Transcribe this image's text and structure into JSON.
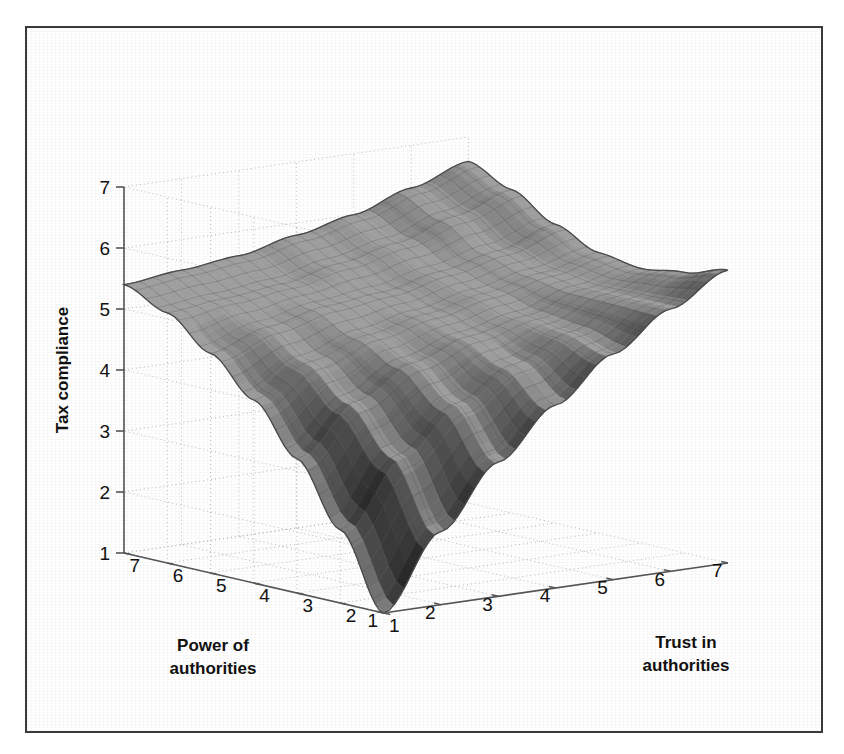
{
  "figure": {
    "background_color": "#ffffff",
    "frame_color": "#3a3a3a",
    "surface_color": "#6a6a6a",
    "surface_edge_color": "#4a4a4a",
    "grid_color": "#b9b9b9",
    "axis_color": "#555555"
  },
  "chart_data": {
    "type": "surface",
    "title": "",
    "subtitle": "",
    "xlabel": "Trust in authorities",
    "ylabel": "Power of authorities",
    "zlabel": "Tax compliance",
    "xlim": [
      1,
      7
    ],
    "ylim": [
      1,
      7
    ],
    "zlim": [
      1,
      7
    ],
    "xticks": [
      1,
      2,
      3,
      4,
      5,
      6,
      7
    ],
    "yticks": [
      7,
      6,
      5,
      4,
      3,
      2,
      1
    ],
    "zticks": [
      1,
      2,
      3,
      4,
      5,
      6,
      7
    ],
    "xtick_labels": [
      "1",
      "2",
      "3",
      "4",
      "5",
      "6",
      "7"
    ],
    "ytick_labels": [
      "7",
      "6",
      "5",
      "4",
      "3",
      "2",
      "1"
    ],
    "ztick_labels": [
      "1",
      "2",
      "3",
      "4",
      "5",
      "6",
      "7"
    ],
    "grid": true,
    "legend": false,
    "legend_position": "none",
    "mesh_wireframe": true,
    "annotations": [],
    "view": {
      "azimuth": -45,
      "elevation": 22
    },
    "x": [
      1,
      2,
      3,
      4,
      5,
      6,
      7
    ],
    "y": [
      1,
      2,
      3,
      4,
      5,
      6,
      7
    ],
    "z_rows_note": "rows indexed by Power of authorities 1..7, columns by Trust in authorities 1..7",
    "z": [
      [
        1.0,
        2.2,
        3.2,
        4.0,
        4.7,
        5.3,
        5.8
      ],
      [
        2.2,
        3.3,
        4.0,
        4.5,
        4.9,
        5.3,
        5.6
      ],
      [
        3.2,
        4.0,
        4.5,
        4.8,
        5.0,
        5.3,
        5.5
      ],
      [
        4.0,
        4.5,
        4.8,
        5.0,
        5.2,
        5.4,
        5.6
      ],
      [
        4.6,
        4.9,
        5.1,
        5.2,
        5.4,
        5.6,
        5.9
      ],
      [
        5.1,
        5.2,
        5.3,
        5.5,
        5.7,
        6.0,
        6.3
      ],
      [
        5.4,
        5.5,
        5.6,
        5.8,
        6.0,
        6.3,
        6.6
      ]
    ],
    "corner_values": {
      "low_trust_low_power": 1.0,
      "high_power_low_trust": 5.4,
      "high_trust_low_power": 5.8,
      "high_trust_high_power": 6.6
    }
  }
}
